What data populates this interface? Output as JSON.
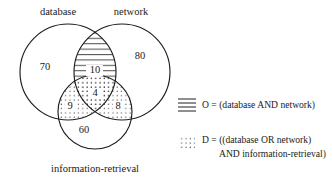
{
  "diagram": {
    "type": "venn-3-set",
    "sets": [
      {
        "id": "database",
        "label": "database"
      },
      {
        "id": "network",
        "label": "network"
      },
      {
        "id": "information-retrieval",
        "label": "information-retrieval"
      }
    ],
    "regions": [
      {
        "id": "database-only",
        "value": "70"
      },
      {
        "id": "network-only",
        "value": "80"
      },
      {
        "id": "database-and-network",
        "value": "10",
        "fill": "horizontal-hatch"
      },
      {
        "id": "all-three",
        "value": "4",
        "fill": "dots"
      },
      {
        "id": "database-and-ir",
        "value": "9",
        "fill": "dots"
      },
      {
        "id": "network-and-ir",
        "value": "8",
        "fill": "dots"
      },
      {
        "id": "ir-only",
        "value": "60"
      }
    ]
  },
  "legend": {
    "entries": [
      {
        "id": "O",
        "swatch": "horizontal-lines-swatch",
        "lines": [
          "O = (database AND network)"
        ]
      },
      {
        "id": "D",
        "swatch": "dotted-swatch",
        "lines": [
          "D = ((database OR network)",
          "AND information-retrieval)"
        ]
      }
    ]
  },
  "colors": {
    "stroke": "#1d1d1d",
    "text": "#1a1a1a",
    "background": "#ffffff"
  }
}
